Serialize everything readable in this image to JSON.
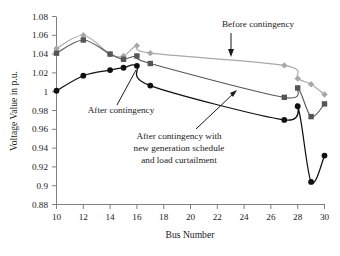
{
  "chart_data": {
    "type": "line",
    "title": "",
    "xlabel": "Bus Number",
    "ylabel": "Voltage Value in p.u.",
    "xlim": [
      10,
      30
    ],
    "ylim": [
      0.88,
      1.08
    ],
    "xticks": [
      10,
      12,
      14,
      16,
      18,
      20,
      22,
      24,
      26,
      28,
      30
    ],
    "xtick_labels": [
      "10",
      "12",
      "14",
      "16",
      "18",
      "20",
      "22",
      "24",
      "26",
      "28",
      "30"
    ],
    "yticks": [
      0.88,
      0.9,
      0.92,
      0.94,
      0.96,
      0.98,
      1.0,
      1.02,
      1.04,
      1.06,
      1.08
    ],
    "ytick_labels": [
      "0.88",
      "0.9",
      "0.92",
      "0.94",
      "0.96",
      "0.98",
      "1",
      "1.02",
      "1.04",
      "1.06",
      "1.08"
    ],
    "grid": false,
    "legend_position": "none-inline-annotations",
    "x": [
      10,
      12,
      14,
      15,
      16,
      17,
      27,
      28,
      29,
      30
    ],
    "series": [
      {
        "name": "Before contingency",
        "color": "#a8a8a8",
        "marker": "diamond",
        "values": [
          1.046,
          1.06,
          1.04,
          1.038,
          1.049,
          1.041,
          1.028,
          1.014,
          1.008,
          0.997
        ]
      },
      {
        "name": "After contingency",
        "color": "#555555",
        "marker": "square",
        "values": [
          1.041,
          1.055,
          1.04,
          1.0345,
          1.038,
          1.03,
          0.994,
          1.004,
          0.9735,
          0.987
        ]
      },
      {
        "name": "After contingency with new generation schedule and load curtailment",
        "color": "#101010",
        "marker": "circle",
        "values": [
          1.001,
          1.017,
          1.023,
          1.0255,
          1.0275,
          1.0065,
          0.97,
          0.9845,
          0.904,
          0.932
        ]
      }
    ],
    "annotations": [
      {
        "id": "before-contingency",
        "text": "Before contingency",
        "lines": [
          "Before contingency"
        ],
        "x_px": 258,
        "y_px": 27,
        "anchor": "middle"
      },
      {
        "id": "after-contingency",
        "text": "After contingency",
        "lines": [
          "After contingency"
        ],
        "x_px": 121,
        "y_px": 113,
        "anchor": "middle"
      },
      {
        "id": "after-contingency-new-schedule",
        "text": "After contingency with new generation schedule and load curtailment",
        "lines": [
          "After contingency with",
          "new generation schedule",
          "and load curtailment"
        ],
        "x_px": 179,
        "y_px": 139,
        "anchor": "middle"
      }
    ]
  }
}
